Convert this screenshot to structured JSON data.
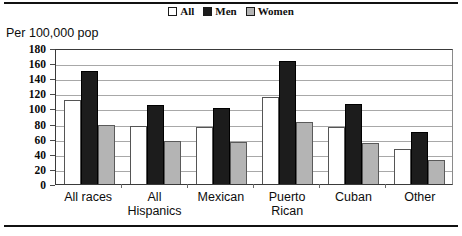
{
  "chart_data": {
    "type": "bar",
    "title": "",
    "subtitle": "",
    "ylabel": "Per 100,000 pop",
    "xlabel": "",
    "ylim": [
      0,
      180
    ],
    "ytick_step": 20,
    "yticks": [
      "180",
      "160",
      "140",
      "120",
      "100",
      "80",
      "60",
      "40",
      "20",
      "0"
    ],
    "grid": true,
    "legend_position": "top-center",
    "categories": [
      "All races",
      "All Hispanics",
      "Mexican",
      "Puerto Rican",
      "Cuban",
      "Other"
    ],
    "category_lines": [
      [
        "All races",
        ""
      ],
      [
        "All",
        "Hispanics"
      ],
      [
        "Mexican",
        ""
      ],
      [
        "Puerto",
        "Rican"
      ],
      [
        "Cuban",
        ""
      ],
      [
        "Other",
        ""
      ]
    ],
    "series": [
      {
        "name": "All",
        "color": "#ffffff",
        "values": [
          111,
          77,
          75,
          115,
          76,
          46
        ]
      },
      {
        "name": "Men",
        "color": "#1c1c1c",
        "values": [
          150,
          105,
          100,
          163,
          106,
          69
        ]
      },
      {
        "name": "Women",
        "color": "#b4b4b4",
        "values": [
          78,
          57,
          56,
          82,
          54,
          32
        ]
      }
    ]
  },
  "legend": {
    "items": [
      {
        "label": "All",
        "swatch": "#ffffff"
      },
      {
        "label": "Men",
        "swatch": "#1c1c1c"
      },
      {
        "label": "Women",
        "swatch": "#b4b4b4"
      }
    ]
  },
  "axis": {
    "y_title": "Per 100,000 pop"
  }
}
